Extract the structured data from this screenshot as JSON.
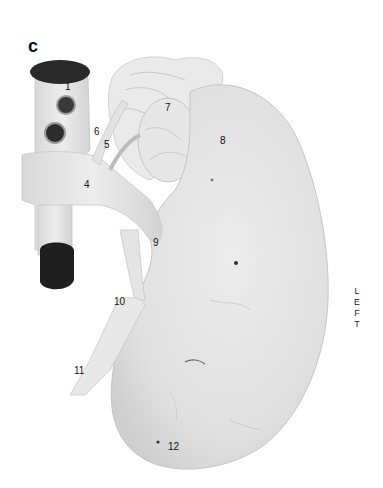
{
  "figure": {
    "panel_letter": "c",
    "side_label": [
      "L",
      "E",
      "F",
      "T"
    ],
    "labels": [
      {
        "id": "1",
        "text": "1",
        "x": 65,
        "y": 82
      },
      {
        "id": "2",
        "text": "2",
        "x": 65,
        "y": 102
      },
      {
        "id": "3",
        "text": "3",
        "x": 55,
        "y": 130
      },
      {
        "id": "4",
        "text": "4",
        "x": 84,
        "y": 180
      },
      {
        "id": "5",
        "text": "5",
        "x": 104,
        "y": 140
      },
      {
        "id": "6",
        "text": "6",
        "x": 94,
        "y": 127
      },
      {
        "id": "7",
        "text": "7",
        "x": 165,
        "y": 103
      },
      {
        "id": "8",
        "text": "8",
        "x": 220,
        "y": 136
      },
      {
        "id": "9",
        "text": "9",
        "x": 153,
        "y": 238
      },
      {
        "id": "10",
        "text": "10",
        "x": 114,
        "y": 297
      },
      {
        "id": "11",
        "text": "11",
        "x": 74,
        "y": 366
      },
      {
        "id": "12",
        "text": "12",
        "x": 168,
        "y": 442
      }
    ],
    "colors": {
      "background": "#ffffff",
      "kidney": "#e4e4e4",
      "vessel": "#dcdcdc",
      "lumen": "#1e1e1e",
      "text": "#111111"
    }
  }
}
